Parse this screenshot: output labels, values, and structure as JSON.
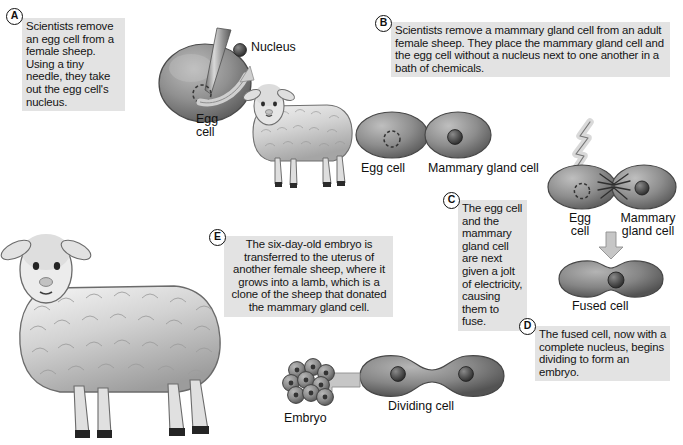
{
  "diagram": {
    "colors": {
      "callout_bg": "#e3e3e3",
      "text": "#141414",
      "cell_fill": "#8d8d8d",
      "cell_dark": "#5f5f5f",
      "nucleus": "#3b3b3b",
      "arrow": "#b4b4b4",
      "page_bg": "#ffffff"
    }
  },
  "steps": [
    {
      "letter": "A",
      "text": "Scientists remove an egg cell from a female sheep. Using a tiny needle, they take out the egg cell's nucleus."
    },
    {
      "letter": "B",
      "text": "Scientists remove a mammary gland cell from an adult female sheep. They place the mammary gland cell and the egg cell without a nucleus next to one another in a bath of chemicals."
    },
    {
      "letter": "C",
      "text": "The egg cell and the mammary gland cell are next given a jolt of electricity, causing them to fuse."
    },
    {
      "letter": "D",
      "text": "The fused cell, now with a complete nucleus, begins dividing to form an embryo."
    },
    {
      "letter": "E",
      "text": "The six-day-old embryo is transferred to the uterus of another female sheep, where it grows into a lamb, which is a clone of the sheep that donated the mammary gland cell."
    }
  ],
  "labels": {
    "nucleus": "Nucleus",
    "egg_cell_a": "Egg\ncell",
    "egg_cell_b": "Egg cell",
    "mammary_gland_cell_b": "Mammary gland cell",
    "egg_cell_c": "Egg\ncell",
    "mammary_gland_cell_c": "Mammary\ngland cell",
    "fused_cell": "Fused cell",
    "dividing_cell": "Dividing cell",
    "embryo": "Embryo"
  }
}
